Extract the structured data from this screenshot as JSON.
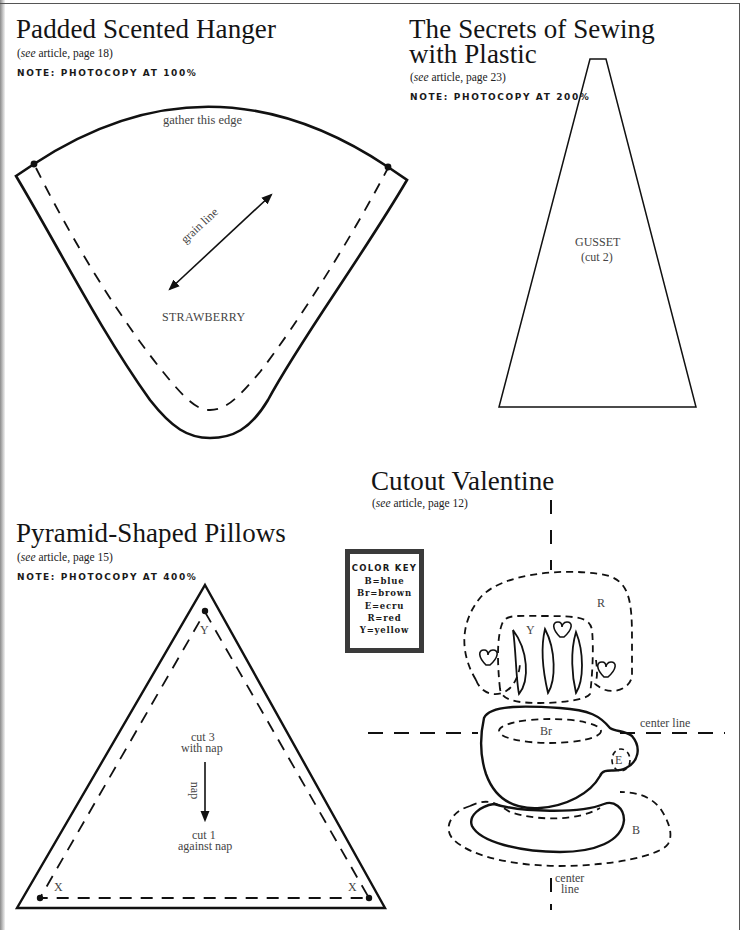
{
  "sections": {
    "hanger": {
      "title": "Padded Scented Hanger",
      "ref_prefix": "see",
      "ref_suffix": " article, page 18)",
      "ref_open": "(",
      "note": "NOTE: PHOTOCOPY AT 100%",
      "labels": {
        "gather": "gather this edge",
        "grain": "grain line",
        "piece": "STRAWBERRY"
      }
    },
    "plastic": {
      "title_line1": "The Secrets of Sewing",
      "title_line2": "with Plastic",
      "ref_open": "(",
      "ref_prefix": "see",
      "ref_suffix": " article, page 23)",
      "note": "NOTE: PHOTOCOPY AT 200%",
      "labels": {
        "piece": "GUSSET",
        "cut": "(cut 2)"
      }
    },
    "pillows": {
      "title": "Pyramid-Shaped Pillows",
      "ref_open": "(",
      "ref_prefix": "see",
      "ref_suffix": " article, page 15)",
      "note": "NOTE: PHOTOCOPY AT 400%",
      "labels": {
        "top_point": "Y",
        "left_point": "X",
        "right_point": "X",
        "cut_with_line1": "cut 3",
        "cut_with_line2": "with nap",
        "nap": "nap",
        "cut_against_line1": "cut 1",
        "cut_against_line2": "against nap"
      }
    },
    "valentine": {
      "title": "Cutout Valentine",
      "ref_open": "(",
      "ref_prefix": "see",
      "ref_suffix": " article, page 12)",
      "color_key": {
        "title": "COLOR KEY",
        "items": [
          "B=blue",
          "Br=brown",
          "E=ecru",
          "R=red",
          "Y=yellow"
        ]
      },
      "labels": {
        "R": "R",
        "Y": "Y",
        "Br": "Br",
        "E": "E",
        "B": "B",
        "center_h": "center line",
        "center_v_line1": "center",
        "center_v_line2": "line"
      }
    }
  }
}
